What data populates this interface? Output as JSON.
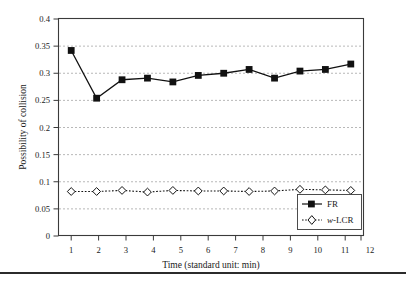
{
  "figure": {
    "background_color": "#ffffff",
    "frame_color": "#3a3a3a",
    "gridline_color": "#9a9a9a",
    "bottom_rule": true
  },
  "chart_data": {
    "type": "line",
    "title": "",
    "subtitle": "",
    "xlabel": "Time (standard unit: min)",
    "ylabel": "Possibility of collision",
    "x": [
      1,
      2,
      3,
      4,
      5,
      6,
      7,
      8,
      9,
      10,
      11,
      12
    ],
    "xtick_labels": [
      "1",
      "2",
      "3",
      "4",
      "5",
      "6",
      "7",
      "8",
      "9",
      "10",
      "11",
      "12"
    ],
    "ytick_labels": [
      "0",
      "0.05",
      "0.1",
      "0.15",
      "0.2",
      "0.25",
      "0.3",
      "0.35",
      "0.4"
    ],
    "ytick_values": [
      0,
      0.05,
      0.1,
      0.15,
      0.2,
      0.25,
      0.3,
      0.35,
      0.4
    ],
    "xlim": [
      0.5,
      12.5
    ],
    "ylim": [
      0,
      0.4
    ],
    "grid": "horizontal-dashed",
    "legend_position": "bottom-right",
    "series": [
      {
        "name": "FR",
        "label": "FR",
        "marker": "filled-square",
        "line_style": "solid",
        "color": "#111111",
        "values": [
          0.342,
          0.254,
          0.288,
          0.291,
          0.284,
          0.296,
          0.3,
          0.307,
          0.291,
          0.304,
          0.307,
          0.317
        ]
      },
      {
        "name": "w-LCR",
        "label": "w-LCR",
        "label_italic_prefix": "w",
        "label_rest": "-LCR",
        "marker": "open-diamond",
        "line_style": "dotted",
        "color": "#111111",
        "values": [
          0.082,
          0.082,
          0.084,
          0.081,
          0.084,
          0.083,
          0.083,
          0.082,
          0.083,
          0.086,
          0.085,
          0.084
        ]
      }
    ]
  }
}
